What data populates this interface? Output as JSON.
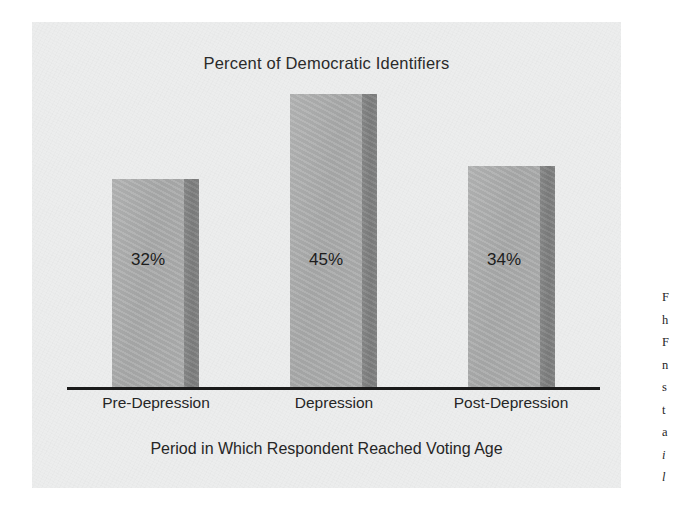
{
  "figure": {
    "background_color": "#ffffff",
    "panel_color": "#eceded"
  },
  "chart_data": {
    "type": "bar",
    "title": "Percent of Democratic Identifiers",
    "xlabel": "Period in Which Respondent Reached Voting Age",
    "ylabel": "",
    "categories": [
      "Pre-Depression",
      "Depression",
      "Post-Depression"
    ],
    "values": [
      32,
      45,
      34
    ],
    "value_labels": [
      "32%",
      "45%",
      "34%"
    ],
    "value_unit": "%",
    "ylim": [
      0,
      50
    ],
    "grid": false,
    "legend": null,
    "bar_style": {
      "face_color": "#adaeae",
      "side_color": "#838484",
      "three_d_side": true
    },
    "axis_line_color": "#1b1b1b"
  },
  "side_text": {
    "truncated": true,
    "lines": [
      {
        "text": "F",
        "italic": false
      },
      {
        "text": "h",
        "italic": false
      },
      {
        "text": "F",
        "italic": false
      },
      {
        "text": "n",
        "italic": false
      },
      {
        "text": "s",
        "italic": false
      },
      {
        "text": "t",
        "italic": false
      },
      {
        "text": "a",
        "italic": false
      },
      {
        "text": "i",
        "italic": true
      },
      {
        "text": "l",
        "italic": true
      }
    ]
  }
}
